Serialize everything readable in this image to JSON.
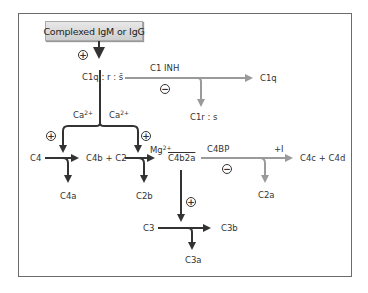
{
  "diagram": {
    "title_box": "Complexed IgM or IgG",
    "nodes": {
      "c1_complex": "C1q : r : s̄",
      "c1_inh": "C1 INH",
      "c1q": "C1q",
      "c1rs": "C1r : s",
      "ca_left": "Ca",
      "ca_right": "Ca",
      "ca_sup": "2+",
      "c4": "C4",
      "c4b_c2": "C4b + C2",
      "c4a": "C4a",
      "mg": "Mg",
      "mg_sup": "2+",
      "c4b2a": "C4b2a",
      "c2b": "C2b",
      "c4bp": "C4BP",
      "plus_i": "+I",
      "c4c_c4d": "C4c + C4d",
      "c2a": "C2a",
      "c3": "C3",
      "c3b": "C3b",
      "c3a": "C3a"
    },
    "symbols": {
      "plus": "+",
      "minus": "−"
    },
    "colors": {
      "main_arrow": "#333333",
      "inhibit_arrow": "#9a9a9a",
      "frame": "#6b6b6b",
      "box_fill": "#d9d9d9"
    }
  }
}
